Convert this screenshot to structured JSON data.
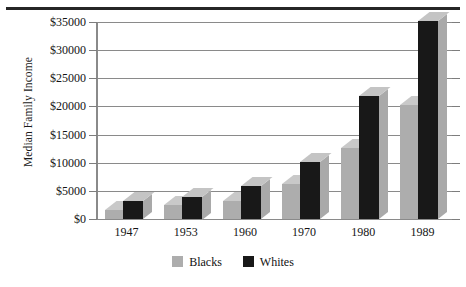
{
  "chart_data": {
    "type": "bar",
    "title": "",
    "subtitle": "",
    "xlabel": "",
    "ylabel": "Median Family Income",
    "categories": [
      "1947",
      "1953",
      "1960",
      "1970",
      "1980",
      "1989"
    ],
    "series": [
      {
        "name": "Blacks",
        "color": "#adadad",
        "values": [
          1600,
          2500,
          3200,
          6300,
          12700,
          20200
        ]
      },
      {
        "name": "Whites",
        "color": "#181818",
        "values": [
          3200,
          4000,
          5800,
          10200,
          21900,
          35200
        ]
      }
    ],
    "ylim": [
      0,
      35000
    ],
    "ytick_values": [
      0,
      5000,
      10000,
      15000,
      20000,
      25000,
      30000,
      35000
    ],
    "ytick_labels": [
      "$0",
      "$5000",
      "$10000",
      "$15000",
      "$20000",
      "$25000",
      "$30000",
      "$35000"
    ],
    "grid": true,
    "grid_axis": "y",
    "legend_position": "bottom-center",
    "style": "3d-bars",
    "annotations": []
  },
  "axis": {
    "y_title": "Median Family Income"
  },
  "legend": {
    "items": [
      {
        "label": "Blacks",
        "swatch": "gray-swatch-icon"
      },
      {
        "label": "Whites",
        "swatch": "black-swatch-icon"
      }
    ]
  }
}
